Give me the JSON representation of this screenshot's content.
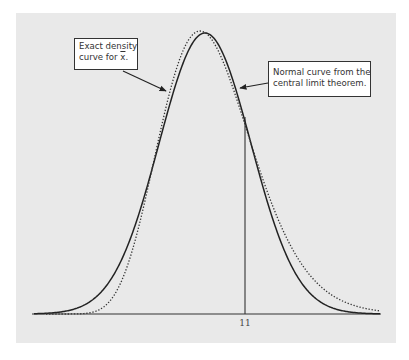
{
  "chart_data": {
    "type": "line",
    "title": "",
    "xlabel": "",
    "ylabel": "",
    "x_tick_labels": [
      "11"
    ],
    "grid": false,
    "legend": "none (callout annotations)",
    "series": [
      {
        "name": "Exact density curve for x̄",
        "style": "dotted",
        "color": "#333333",
        "shape": "right-skewed density, peak slightly left of normal peak",
        "peak_x_px": 200
      },
      {
        "name": "Normal curve from the central limit theorem",
        "style": "solid",
        "color": "#222222",
        "shape": "symmetric normal density",
        "peak_x_px": 205
      }
    ],
    "reference_line": {
      "x_label": "11",
      "type": "vertical line from axis to curve"
    },
    "annotations": [
      {
        "text": "Exact density curve for x̄.",
        "points_to": "dotted curve (left side)"
      },
      {
        "text": "Normal curve from the central limit theorem.",
        "points_to": "solid curve (right side)"
      }
    ]
  },
  "annotations": {
    "exact": {
      "line1": "Exact density",
      "line2_prefix": "curve for ",
      "line2_sym": "x",
      "line2_suffix": "."
    },
    "normal": {
      "line1": "Normal curve from the",
      "line2": "central limit theorem."
    }
  },
  "axis": {
    "tick_label": "11"
  },
  "colors": {
    "plot_background": "#e9e9e9",
    "page_background": "#ffffff",
    "line": "#222222"
  }
}
